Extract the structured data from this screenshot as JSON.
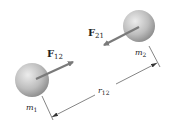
{
  "diagram": {
    "masses": [
      {
        "id": "m1",
        "label": "m",
        "subscript": "1"
      },
      {
        "id": "m2",
        "label": "m",
        "subscript": "2"
      }
    ],
    "forces": [
      {
        "id": "F12",
        "label": "F",
        "subscript": "12",
        "acts_on": "m1",
        "direction": "toward m2"
      },
      {
        "id": "F21",
        "label": "F",
        "subscript": "21",
        "acts_on": "m2",
        "direction": "toward m1"
      }
    ],
    "distance": {
      "label": "r",
      "subscript": "12"
    },
    "colors": {
      "sphere_light": "#e4e4e4",
      "sphere_dark": "#8a8a8a",
      "arrow": "#7a7a7a",
      "line": "#333333",
      "text": "#222222"
    }
  }
}
